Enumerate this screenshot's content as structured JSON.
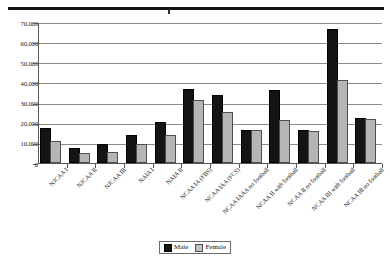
{
  "page": {
    "top_rule": "horizontal-rule"
  },
  "legend": {
    "male_label": "Male",
    "female_label": "Female",
    "male_color": "#141414",
    "female_color": "#b5b5b5",
    "position": "bottom-center"
  },
  "chart_data": {
    "type": "bar",
    "title": "",
    "subtitle": "",
    "xlabel": "",
    "ylabel": "",
    "ylim": [
      0,
      70000
    ],
    "yticks": [
      "0",
      "10,000",
      "20,000",
      "30,000",
      "40,000",
      "50,000",
      "60,000",
      "70,000"
    ],
    "ytick_values": [
      0,
      10000,
      20000,
      30000,
      40000,
      50000,
      60000,
      70000
    ],
    "grid": true,
    "grid_axis": "y",
    "legend_entries": [
      "Male",
      "Female"
    ],
    "categories": [
      "NJCAA I",
      "NJCAA II",
      "NJCAA III",
      "NAIA I",
      "NAIA II",
      "NCAA IA (FBS)",
      "NCAA IAA (FCS)",
      "NCAA IAAA no football",
      "NCAA II with football",
      "NCAA II no football",
      "NCAA III with football",
      "NCAA III no football"
    ],
    "series": [
      {
        "name": "Male",
        "color": "#141414",
        "values": [
          16300,
          6700,
          8300,
          12700,
          19400,
          36000,
          32700,
          15300,
          35200,
          15300,
          65500,
          21500
        ]
      },
      {
        "name": "Female",
        "color": "#b5b5b5",
        "values": [
          10000,
          4200,
          4500,
          8500,
          12800,
          30200,
          24500,
          15200,
          20500,
          14800,
          40000,
          20800
        ]
      }
    ]
  }
}
